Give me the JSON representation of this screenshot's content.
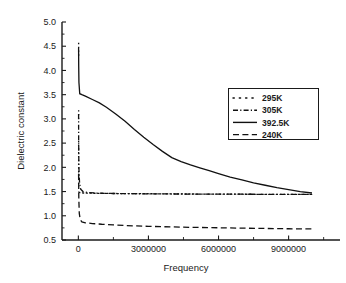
{
  "chart_data": {
    "type": "line",
    "title": "",
    "xlabel": "Frequency",
    "ylabel": "Dielectric constant",
    "xlim": [
      -700000,
      11200000
    ],
    "ylim": [
      0.5,
      5.0
    ],
    "xticks": [
      0,
      3000000,
      6000000,
      9000000
    ],
    "xtick_labels": [
      "0",
      "3000000",
      "6000000",
      "9000000"
    ],
    "yticks": [
      0.5,
      1.0,
      1.5,
      2.0,
      2.5,
      3.0,
      3.5,
      4.0,
      4.5,
      5.0
    ],
    "ytick_labels": [
      "0.5",
      "1.0",
      "1.5",
      "2.0",
      "2.5",
      "3.0",
      "3.5",
      "4.0",
      "4.5",
      "5.0"
    ],
    "grid": false,
    "legend_position": "upper right",
    "series": [
      {
        "name": "295K",
        "style": "dotted",
        "x": [
          20000,
          60000,
          120000,
          200000,
          400000,
          700000,
          1000000,
          1500000,
          2000000,
          2500000,
          3000000,
          3500000,
          4000000,
          4500000,
          5000000,
          5500000,
          6000000,
          6500000,
          7000000,
          7500000,
          8000000,
          8500000,
          9000000,
          9500000,
          10000000
        ],
        "y": [
          1.49,
          1.48,
          1.475,
          1.47,
          1.468,
          1.465,
          1.463,
          1.46,
          1.458,
          1.456,
          1.455,
          1.453,
          1.452,
          1.45,
          1.449,
          1.448,
          1.447,
          1.446,
          1.445,
          1.444,
          1.443,
          1.442,
          1.441,
          1.44,
          1.44
        ]
      },
      {
        "name": "305K",
        "style": "dashdot",
        "x": [
          10000,
          12000,
          15000,
          20000,
          30000,
          50000,
          100000,
          200000,
          400000,
          700000,
          1000000,
          1500000,
          2000000,
          2500000,
          3000000,
          4000000,
          5000000,
          6000000,
          7000000,
          8000000,
          9000000,
          10000000
        ],
        "y": [
          3.1,
          2.8,
          2.45,
          2.1,
          1.88,
          1.7,
          1.55,
          1.5,
          1.48,
          1.47,
          1.465,
          1.46,
          1.457,
          1.455,
          1.453,
          1.45,
          1.448,
          1.446,
          1.445,
          1.443,
          1.441,
          1.44
        ]
      },
      {
        "name": "392.5K",
        "style": "solid",
        "x": [
          10000,
          15000,
          25000,
          60000,
          150000,
          300000,
          600000,
          900000,
          1200000,
          1600000,
          2000000,
          2400000,
          2800000,
          3200000,
          3600000,
          4000000,
          4400000,
          4800000,
          5200000,
          5600000,
          6000000,
          6500000,
          7000000,
          7500000,
          8000000,
          8500000,
          9000000,
          9500000,
          10000000
        ],
        "y": [
          4.47,
          4.1,
          3.75,
          3.52,
          3.5,
          3.47,
          3.4,
          3.33,
          3.24,
          3.1,
          2.95,
          2.78,
          2.62,
          2.47,
          2.33,
          2.2,
          2.12,
          2.05,
          1.99,
          1.93,
          1.87,
          1.8,
          1.74,
          1.68,
          1.63,
          1.58,
          1.54,
          1.5,
          1.47
        ]
      },
      {
        "name": "240K",
        "style": "dashed",
        "x": [
          10000,
          20000,
          40000,
          80000,
          150000,
          300000,
          600000,
          1000000,
          1500000,
          2000000,
          2500000,
          3000000,
          4000000,
          5000000,
          6000000,
          7000000,
          8000000,
          9000000,
          10000000
        ],
        "y": [
          1.87,
          1.35,
          1.05,
          0.92,
          0.875,
          0.855,
          0.84,
          0.825,
          0.812,
          0.8,
          0.79,
          0.782,
          0.77,
          0.76,
          0.752,
          0.745,
          0.738,
          0.732,
          0.728
        ]
      }
    ],
    "spike_markers": [
      {
        "name": "295K-spike",
        "x": 12000,
        "y_top": 4.57,
        "y_bottom": 4.3
      },
      {
        "name": "305K-spike-upper",
        "x": 12000,
        "y_top": 3.18,
        "y_bottom": 2.95
      },
      {
        "name": "305K-spike-lower",
        "x": 12000,
        "y_top": 2.55,
        "y_bottom": 1.6
      }
    ],
    "legend_entries": [
      {
        "label": "295K",
        "style": "dotted"
      },
      {
        "label": "305K",
        "style": "dashdot"
      },
      {
        "label": "392.5K",
        "style": "solid"
      },
      {
        "label": "240K",
        "style": "dashed"
      }
    ]
  }
}
